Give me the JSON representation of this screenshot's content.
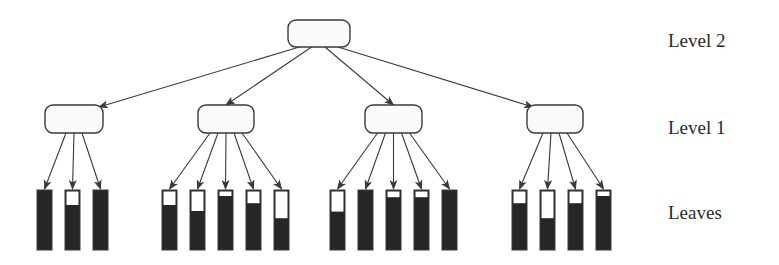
{
  "labels": {
    "level2": "Level 2",
    "level1": "Level 1",
    "leaves": "Leaves"
  },
  "colors": {
    "stroke": "#3a3a3a",
    "fill": "#262626",
    "node_fill": "#fafafa"
  },
  "root": {
    "x": 288,
    "y": 20,
    "w": 62,
    "h": 27
  },
  "level1": [
    {
      "x": 45,
      "y": 105,
      "w": 58,
      "h": 28,
      "leaves": [
        {
          "x": 37,
          "empty": 0
        },
        {
          "x": 65,
          "empty": 0.25
        },
        {
          "x": 93,
          "empty": 0
        }
      ]
    },
    {
      "x": 198,
      "y": 105,
      "w": 56,
      "h": 28,
      "leaves": [
        {
          "x": 162,
          "empty": 0.25
        },
        {
          "x": 190,
          "empty": 0.35
        },
        {
          "x": 218,
          "empty": 0.1
        },
        {
          "x": 246,
          "empty": 0.22
        },
        {
          "x": 274,
          "empty": 0.47
        }
      ]
    },
    {
      "x": 365,
      "y": 105,
      "w": 57,
      "h": 28,
      "leaves": [
        {
          "x": 330,
          "empty": 0.36
        },
        {
          "x": 358,
          "empty": 0
        },
        {
          "x": 386,
          "empty": 0.12
        },
        {
          "x": 414,
          "empty": 0.12
        },
        {
          "x": 442,
          "empty": 0
        }
      ]
    },
    {
      "x": 527,
      "y": 105,
      "w": 56,
      "h": 28,
      "leaves": [
        {
          "x": 512,
          "empty": 0.22
        },
        {
          "x": 540,
          "empty": 0.47
        },
        {
          "x": 568,
          "empty": 0.22
        },
        {
          "x": 596,
          "empty": 0.1
        }
      ]
    }
  ],
  "leaf_geom": {
    "y": 190,
    "w": 15,
    "h": 60
  }
}
